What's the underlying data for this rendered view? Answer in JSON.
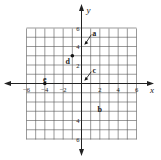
{
  "diagram": {
    "type": "coordinate-plane",
    "x_axis_label": "x",
    "y_axis_label": "y",
    "range": {
      "xmin": -6,
      "xmax": 6,
      "ymin": -6,
      "ymax": 6
    },
    "x_tick_labels": [
      "−6",
      "−4",
      "−2",
      "2",
      "4",
      "6"
    ],
    "y_tick_labels": [
      "6",
      "4",
      "2",
      "4",
      "6"
    ],
    "points": [
      {
        "label": "a",
        "x": 0.3,
        "y": 4.2,
        "marker": "arrow",
        "label_pos": [
          1.4,
          5.5
        ]
      },
      {
        "label": "b",
        "x": 2.0,
        "y": -2.5,
        "marker": "none",
        "label_pos": [
          2.0,
          -2.8
        ]
      },
      {
        "label": "c",
        "x": 0.3,
        "y": 0.3,
        "marker": "arrow",
        "label_pos": [
          1.4,
          1.5
        ]
      },
      {
        "label": "d",
        "x": -1.0,
        "y": 3.0,
        "marker": "dot",
        "label_pos": [
          -1.5,
          2.4
        ]
      },
      {
        "label": "e",
        "x": -4.0,
        "y": 0.0,
        "marker": "dot",
        "label_pos": [
          -4.0,
          0.5
        ]
      }
    ],
    "colors": {
      "grid": "#555555",
      "axis": "#222222",
      "point": "#111111"
    }
  }
}
